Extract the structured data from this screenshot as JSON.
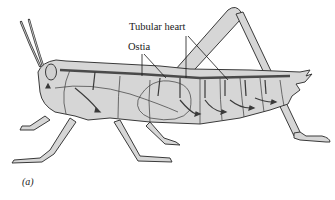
{
  "figure": {
    "panel_label": "(a)",
    "labels": {
      "tubular_heart": "Tubular heart",
      "ostia": "Ostia"
    },
    "colors": {
      "body_fill": "#d6d6d6",
      "outline": "#3a3a3a",
      "heart_vessel": "#4a4a4a",
      "background": "#ffffff"
    }
  }
}
